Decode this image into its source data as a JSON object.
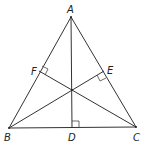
{
  "diagram": {
    "type": "triangle-altitudes",
    "points": {
      "A": {
        "label": "A",
        "x": 71,
        "y": 17
      },
      "B": {
        "label": "B",
        "x": 9,
        "y": 128
      },
      "C": {
        "label": "C",
        "x": 136,
        "y": 127
      },
      "D": {
        "label": "D",
        "x": 72,
        "y": 128
      },
      "E": {
        "label": "E",
        "x": 104,
        "y": 71
      },
      "F": {
        "label": "F",
        "x": 39,
        "y": 71
      },
      "H": {
        "label": "",
        "x": 72,
        "y": 90
      }
    },
    "segments": [
      "AB",
      "BC",
      "CA",
      "AD",
      "BE",
      "CF"
    ],
    "right_angles": [
      "D",
      "E",
      "F"
    ],
    "labels": {
      "A": "A",
      "B": "B",
      "C": "C",
      "D": "D",
      "E": "E",
      "F": "F"
    }
  }
}
